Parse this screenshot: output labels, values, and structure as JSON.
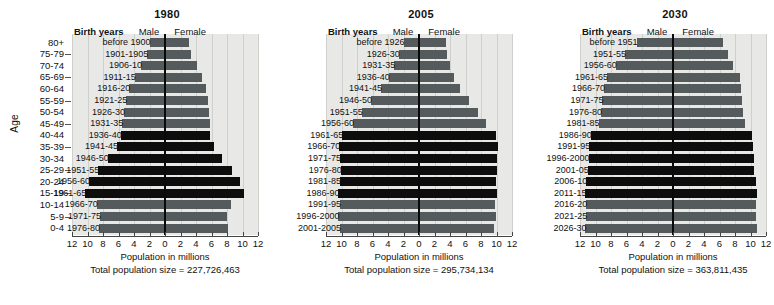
{
  "figure": {
    "age_axis_title": "Age",
    "age_groups": [
      "80+",
      "75-79",
      "70-74",
      "65-69",
      "60-64",
      "55-59",
      "50-54",
      "45-49",
      "40-44",
      "35-39",
      "30-34",
      "25-29",
      "20-24",
      "15-19",
      "10-14",
      "5-9",
      "0-4"
    ],
    "x_tick_labels": [
      "12",
      "10",
      "8",
      "6",
      "4",
      "2",
      "0",
      "2",
      "4",
      "6",
      "8",
      "10",
      "12"
    ],
    "x_axis_title": "Population in millions",
    "header_birth_years": "Birth years",
    "header_male": "Male",
    "header_female": "Female",
    "colors": {
      "plot_background": "#e8e8e6",
      "bar_normal": "#555a5c",
      "bar_boomer": "#0d0d0d",
      "axis": "#444444",
      "center_line": "#0a0a0a",
      "gridline": "#cfcfcc",
      "text": "#111111"
    }
  },
  "chart_data": {
    "type": "bar",
    "xlabel": "Population in millions",
    "ylabel": "Age",
    "xlim": [
      -12,
      12
    ],
    "grid": true,
    "legend_position": "top",
    "categories": [
      "80+",
      "75-79",
      "70-74",
      "65-69",
      "60-64",
      "55-59",
      "50-54",
      "45-49",
      "40-44",
      "35-39",
      "30-34",
      "25-29",
      "20-24",
      "15-19",
      "10-14",
      "5-9",
      "0-4"
    ],
    "panels": [
      {
        "year": "1980",
        "total_population_label": "Total population size = 227,726,463",
        "total_population": 227726463,
        "birth_years": [
          "before 1900",
          "1901-1905",
          "1906-10",
          "1911-15",
          "1916-20",
          "1921-25",
          "1926-30",
          "1931-35",
          "1936-40",
          "1941-45",
          "1946-50",
          "1951-55",
          "1956-60",
          "1961-65",
          "1966-70",
          "1971-75",
          "1976-80"
        ],
        "male": [
          2.0,
          2.3,
          3.1,
          3.9,
          4.6,
          5.0,
          5.3,
          5.5,
          5.7,
          6.2,
          7.4,
          8.6,
          9.8,
          10.3,
          8.8,
          8.4,
          8.5
        ],
        "female": [
          3.1,
          3.3,
          4.1,
          4.8,
          5.3,
          5.6,
          5.7,
          5.8,
          5.8,
          6.3,
          7.4,
          8.6,
          9.7,
          10.2,
          8.5,
          8.0,
          8.1
        ],
        "boomer_flags": [
          false,
          false,
          false,
          false,
          false,
          false,
          false,
          false,
          true,
          true,
          true,
          true,
          true,
          true,
          false,
          false,
          false
        ]
      },
      {
        "year": "2005",
        "total_population_label": "Total population size = 295,734,134",
        "total_population": 295734134,
        "birth_years": [
          "before 1926",
          "1926-30",
          "1931-35",
          "1936-40",
          "1941-45",
          "1946-50",
          "1951-55",
          "1956-60",
          "1961-65",
          "1966-70",
          "1971-75",
          "1976-80",
          "1981-85",
          "1986-90",
          "1991-95",
          "1996-2000",
          "2001-2005"
        ],
        "male": [
          2.0,
          2.6,
          3.2,
          3.9,
          4.9,
          6.2,
          7.4,
          8.5,
          9.9,
          10.3,
          10.2,
          10.1,
          10.2,
          10.4,
          10.2,
          10.4,
          10.2
        ],
        "female": [
          3.5,
          3.6,
          4.0,
          4.5,
          5.3,
          6.5,
          7.6,
          8.6,
          9.9,
          10.2,
          10.1,
          10.0,
          9.9,
          10.1,
          9.8,
          9.9,
          9.7
        ],
        "boomer_flags": [
          false,
          false,
          false,
          false,
          false,
          false,
          false,
          false,
          true,
          true,
          true,
          true,
          true,
          true,
          false,
          false,
          false
        ]
      },
      {
        "year": "2030",
        "total_population_label": "Total population size = 363,811,435",
        "total_population": 363811435,
        "birth_years": [
          "before 1951",
          "1951-55",
          "1956-60",
          "1961-65",
          "1966-70",
          "1971-75",
          "1976-80",
          "1981-85",
          "1986-90",
          "1991-95",
          "1996-2000",
          "2001-05",
          "2006-10",
          "2011-15",
          "2016-20",
          "2021-25",
          "2026-30"
        ],
        "male": [
          4.7,
          6.2,
          7.4,
          8.5,
          8.9,
          9.1,
          9.3,
          9.6,
          10.6,
          10.8,
          10.9,
          11.0,
          11.2,
          11.3,
          11.2,
          11.2,
          11.3
        ],
        "female": [
          6.5,
          7.1,
          7.8,
          8.6,
          8.8,
          8.9,
          9.0,
          9.3,
          10.2,
          10.3,
          10.4,
          10.5,
          10.7,
          10.8,
          10.7,
          10.7,
          10.8
        ],
        "boomer_flags": [
          false,
          false,
          false,
          false,
          false,
          false,
          false,
          false,
          true,
          true,
          true,
          true,
          true,
          true,
          false,
          false,
          false
        ]
      }
    ]
  }
}
